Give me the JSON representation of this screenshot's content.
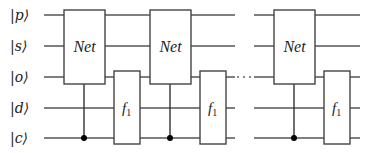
{
  "diagram": {
    "type": "quantum-circuit",
    "qubits": [
      {
        "id": "p",
        "label": "|p⟩",
        "y": 15
      },
      {
        "id": "s",
        "label": "|s⟩",
        "y": 46
      },
      {
        "id": "o",
        "label": "|o⟩",
        "y": 77
      },
      {
        "id": "d",
        "label": "|d⟩",
        "y": 108
      },
      {
        "id": "c",
        "label": "|c⟩",
        "y": 138
      }
    ],
    "gates": {
      "net_label": "Net",
      "f_label": "f",
      "f_subscript": "1"
    },
    "blocks": [
      {
        "index": 1,
        "net_gate": "Net",
        "f_gate": "f1",
        "net_acts_on": [
          "p",
          "s",
          "o"
        ],
        "net_control": "c",
        "f_acts_on": [
          "o",
          "d",
          "c"
        ]
      },
      {
        "index": 2,
        "net_gate": "Net",
        "f_gate": "f1",
        "net_acts_on": [
          "p",
          "s",
          "o"
        ],
        "net_control": "c",
        "f_acts_on": [
          "o",
          "d",
          "c"
        ]
      },
      {
        "index": 3,
        "net_gate": "Net",
        "f_gate": "f1",
        "net_acts_on": [
          "p",
          "s",
          "o"
        ],
        "net_control": "c",
        "f_acts_on": [
          "o",
          "d",
          "c"
        ]
      }
    ],
    "ellipsis": "· · ·",
    "colors": {
      "line": "#555555",
      "box_stroke": "#444444",
      "dot": "#000000",
      "text": "#222222"
    }
  }
}
